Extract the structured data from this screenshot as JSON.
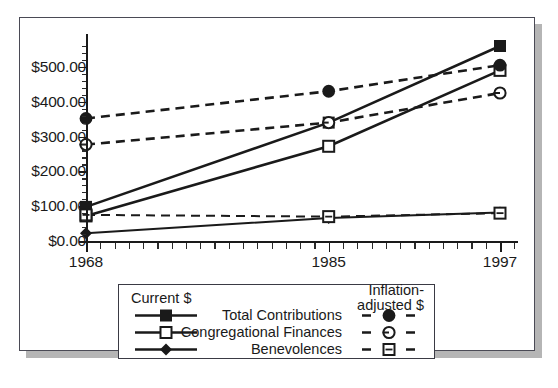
{
  "chart_data": {
    "type": "line",
    "title": "",
    "xlabel": "",
    "ylabel": "",
    "x": [
      1968,
      1985,
      1997
    ],
    "xtick_labels": [
      "1968",
      "1985",
      "1997"
    ],
    "ytick_labels": [
      "$0.00",
      "$100.00",
      "$200.00",
      "$300.00",
      "$400.00",
      "$500.00"
    ],
    "ytick_values": [
      0,
      100,
      200,
      300,
      400,
      500
    ],
    "ylim": [
      0,
      560
    ],
    "xlim": [
      1968,
      1997
    ],
    "grid": false,
    "legend_position": "below-plot",
    "series": [
      {
        "name": "Total Contributions",
        "dollars": "Current $",
        "marker": "filled-square",
        "line": "solid",
        "values": [
          98,
          340,
          560
        ]
      },
      {
        "name": "Congregational Finances",
        "dollars": "Current $",
        "marker": "open-square",
        "line": "solid",
        "values": [
          72,
          272,
          490
        ]
      },
      {
        "name": "Benevolences",
        "dollars": "Current $",
        "marker": "filled-diamond",
        "line": "solid",
        "values": [
          22,
          66,
          82
        ]
      },
      {
        "name": "Total Contributions",
        "dollars": "Inflation-adjusted $",
        "marker": "filled-circle",
        "line": "dashed",
        "values": [
          352,
          430,
          505
        ]
      },
      {
        "name": "Congregational Finances",
        "dollars": "Inflation-adjusted $",
        "marker": "open-circle",
        "line": "dashed",
        "values": [
          277,
          340,
          425
        ]
      },
      {
        "name": "Benevolences",
        "dollars": "Inflation-adjusted $",
        "marker": "open-square-dash",
        "line": "dashed",
        "values": [
          75,
          70,
          80
        ]
      }
    ]
  },
  "legend": {
    "left_header": "Current $",
    "right_header_line1": "Inflation-",
    "right_header_line2": "adjusted $",
    "rows": [
      {
        "label": "Total Contributions",
        "left_marker": "filled-square",
        "right_marker": "filled-circle"
      },
      {
        "label": "Congregational Finances",
        "left_marker": "open-square",
        "right_marker": "open-circle"
      },
      {
        "label": "Benevolences",
        "left_marker": "filled-diamond",
        "right_marker": "open-square-dash"
      }
    ]
  },
  "colors": {
    "line": "#1a1a1a",
    "frame": "#4a4a55",
    "shadow": "#b5b5b5",
    "background": "#ffffff"
  }
}
